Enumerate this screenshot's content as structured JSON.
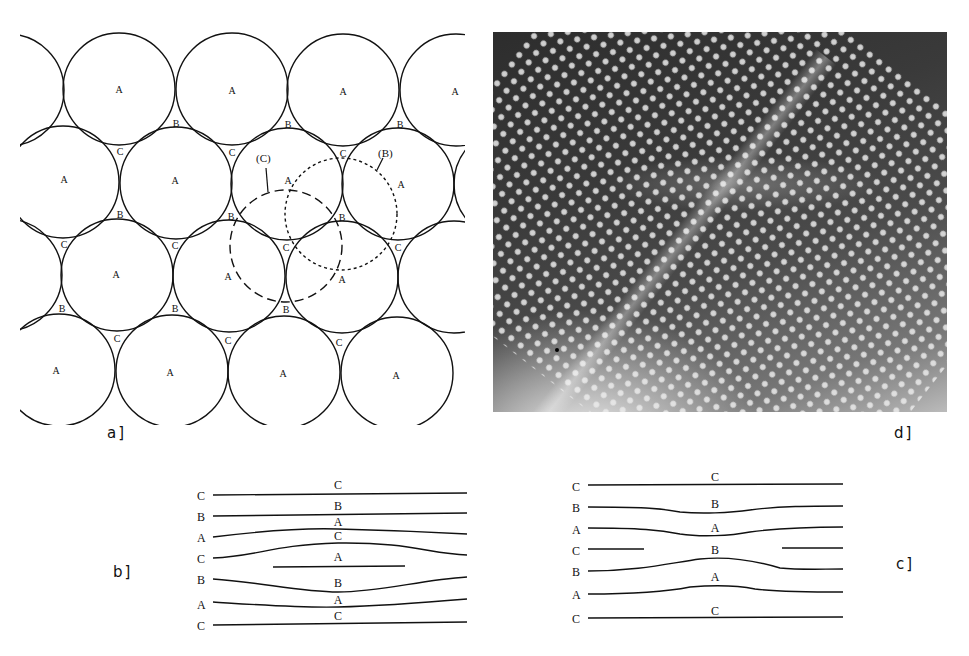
{
  "figure": {
    "panels": {
      "a": {
        "label": "a]",
        "description": "Close-packed layer of spheres with A, B, C stacking positions",
        "site_labels": {
          "A": "A",
          "B": "B",
          "C": "C"
        },
        "callouts": [
          {
            "text": "(C)"
          },
          {
            "text": "(B)"
          }
        ]
      },
      "b": {
        "label": "b]",
        "left_labels": [
          "C",
          "B",
          "A",
          "C",
          "B",
          "A",
          "C"
        ],
        "center_labels": [
          "C",
          "B",
          "A",
          "C",
          "A",
          "B",
          "A",
          "C"
        ]
      },
      "c": {
        "label": "c]",
        "left_labels": [
          "C",
          "B",
          "A",
          "C",
          "B",
          "A",
          "C"
        ],
        "center_labels": [
          "C",
          "B",
          "A",
          "B",
          "A",
          "C"
        ]
      },
      "d": {
        "label": "d]",
        "description": "High-resolution lattice image (micrograph)"
      }
    },
    "colors": {
      "ink": "#111111",
      "background": "#ffffff"
    }
  }
}
